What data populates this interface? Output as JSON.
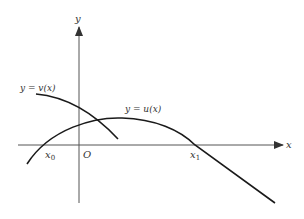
{
  "diagram": {
    "axes": {
      "x_label": "x",
      "y_label": "y",
      "origin_label": "O"
    },
    "curves": [
      {
        "name": "v",
        "label": "y = v(x)"
      },
      {
        "name": "u",
        "label": "y = u(x)"
      }
    ],
    "points": [
      {
        "label_base": "x",
        "label_sub": "0"
      },
      {
        "label_base": "x",
        "label_sub": "1"
      }
    ],
    "colors": {
      "stroke": "#1a1a1a",
      "axis": "#444444",
      "text": "#333333"
    }
  }
}
